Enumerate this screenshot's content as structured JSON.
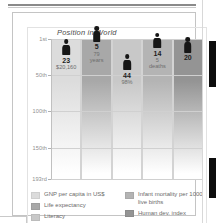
{
  "figure": {
    "title": "Position in World"
  },
  "chart_data": {
    "type": "bar",
    "title": "Position in World",
    "xlabel": "",
    "ylabel": "Position in World",
    "axis_ticks": [
      "1st",
      "50th",
      "100th",
      "150th",
      "193rd"
    ],
    "axis_tick_values": [
      1,
      50,
      100,
      150,
      193
    ],
    "ylim": [
      1,
      193
    ],
    "grid": true,
    "legend_position": "bottom",
    "categories": [
      "GNP per capita in US$",
      "Life expectancy",
      "Literacy",
      "Infant mortality per 1000 live births",
      "Human dev. index"
    ],
    "values": [
      23,
      5,
      44,
      14,
      20
    ],
    "value_labels": [
      "$20,160",
      "79 years",
      "98%",
      "5 deaths",
      ""
    ],
    "columns": [
      {
        "key": "gnp",
        "rank": "23",
        "value_line1": "$20,160",
        "value_line2": "",
        "color": "#dcdcdc"
      },
      {
        "key": "life-expectancy",
        "rank": "5",
        "value_line1": "79",
        "value_line2": "years",
        "color": "#a8a8a8"
      },
      {
        "key": "literacy",
        "rank": "44",
        "value_line1": "98%",
        "value_line2": "",
        "color": "#c8c8c8"
      },
      {
        "key": "infant-mortality",
        "rank": "14",
        "value_line1": "5",
        "value_line2": "deaths",
        "color": "#b4b4b4"
      },
      {
        "key": "human-dev-index",
        "rank": "20",
        "value_line1": "",
        "value_line2": "",
        "color": "#949494"
      }
    ]
  },
  "legend": {
    "left": [
      {
        "label": "GNP per capita in US$",
        "color": "#dcdcdc"
      },
      {
        "label": "Life expectancy",
        "color": "#a8a8a8"
      },
      {
        "label": "Literacy",
        "color": "#c8c8c8"
      }
    ],
    "right": [
      {
        "label": "Infant mortality per 1000 live births",
        "color": "#b4b4b4"
      },
      {
        "label": "Human dev. index",
        "color": "#949494"
      }
    ]
  }
}
